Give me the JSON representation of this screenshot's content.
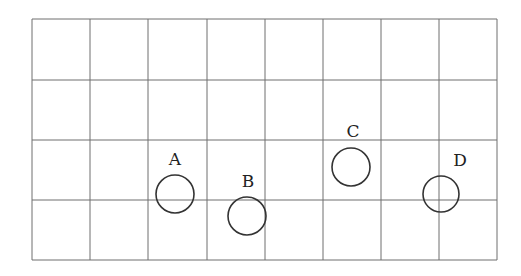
{
  "diagram": {
    "type": "grid-with-circles",
    "grid": {
      "columns": 8,
      "rows": 4,
      "x_lines": [
        32,
        90,
        148,
        207,
        265,
        323,
        381,
        439,
        497
      ],
      "y_lines": [
        19,
        80,
        140,
        200,
        260
      ],
      "line_color": "#6e6e6e"
    },
    "circles": [
      {
        "label": "A",
        "cx": 175,
        "cy": 194,
        "r": 19,
        "label_x": 175,
        "label_y": 165
      },
      {
        "label": "B",
        "cx": 247,
        "cy": 216,
        "r": 19,
        "label_x": 248,
        "label_y": 187
      },
      {
        "label": "C",
        "cx": 351,
        "cy": 167,
        "r": 19,
        "label_x": 353,
        "label_y": 137
      },
      {
        "label": "D",
        "cx": 441,
        "cy": 194,
        "r": 18,
        "label_x": 460,
        "label_y": 166
      }
    ],
    "circle_color": "#333333"
  }
}
